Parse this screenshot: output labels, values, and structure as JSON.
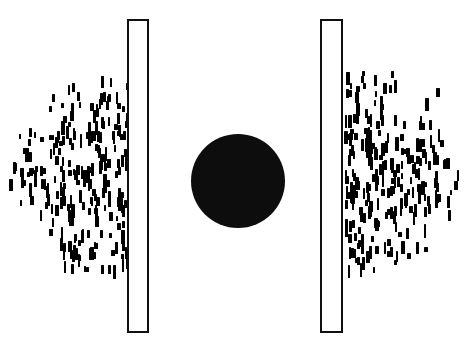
{
  "figure": {
    "width": 464,
    "height": 356,
    "background_color": "#ffffff",
    "ink_color": "#000000"
  },
  "sphere": {
    "label": "central-obstacle-disk",
    "shape": "circle",
    "fill_color": "#0d0d0d",
    "center_x": 238,
    "center_y": 181,
    "radius": 47
  },
  "plates": [
    {
      "label": "left-plate",
      "shape": "rectangle-outline",
      "x": 127,
      "y": 19,
      "width": 22,
      "height": 314,
      "stroke_color": "#111111",
      "stroke_width": 2,
      "fill_color": "#ffffff"
    },
    {
      "label": "right-plate",
      "shape": "rectangle-outline",
      "x": 320,
      "y": 19,
      "width": 23,
      "height": 314,
      "stroke_color": "#111111",
      "stroke_width": 2,
      "fill_color": "#ffffff"
    }
  ],
  "clouds": [
    {
      "label": "left-particle-cloud",
      "side": "left",
      "particle_color": "#000000",
      "bounds": {
        "x": 8,
        "y": 72,
        "width": 122,
        "height": 212
      },
      "dense_edge": "right",
      "particle_count": 236,
      "particle_shape": "vertical-bar",
      "particle_width_range": [
        2,
        4
      ],
      "particle_height_range": [
        5,
        14
      ]
    },
    {
      "label": "right-particle-cloud",
      "side": "right",
      "particle_color": "#000000",
      "bounds": {
        "x": 344,
        "y": 68,
        "width": 116,
        "height": 218
      },
      "dense_edge": "left",
      "particle_count": 236,
      "particle_shape": "vertical-bar",
      "particle_width_range": [
        2,
        4
      ],
      "particle_height_range": [
        5,
        14
      ]
    }
  ]
}
